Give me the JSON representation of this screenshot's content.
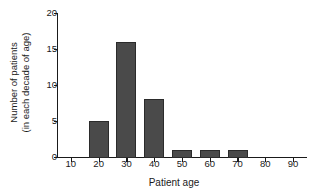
{
  "chart_data": {
    "type": "bar",
    "title": "",
    "subtitle": "",
    "xlabel": "Patient age",
    "ylabel_lines": [
      "Number of patients",
      "(in each decade of age)"
    ],
    "ylabel": "Number of patients (in each decade of age)",
    "categories": [
      "10",
      "20",
      "30",
      "40",
      "50",
      "60",
      "70",
      "80",
      "90"
    ],
    "values": [
      0,
      5,
      16,
      8,
      1,
      1,
      1,
      0,
      0
    ],
    "xlim": [
      5,
      95
    ],
    "ylim": [
      0,
      20
    ],
    "yticks": [
      "20",
      "15",
      "10",
      "5",
      "0"
    ],
    "ytick_values": [
      20,
      15,
      10,
      5,
      0
    ],
    "xticks": [
      "10",
      "20",
      "30",
      "40",
      "50",
      "60",
      "70",
      "80",
      "90"
    ],
    "xtick_values": [
      10,
      20,
      30,
      40,
      50,
      60,
      70,
      80,
      90
    ],
    "grid": false,
    "legend": "none",
    "annotations": [],
    "colors": {
      "bar_fill": "#4a4a4a",
      "bar_border": "#2b2b2b",
      "axis": "#1a1a1a",
      "text": "#1a1a1a",
      "background": "#ffffff"
    }
  }
}
